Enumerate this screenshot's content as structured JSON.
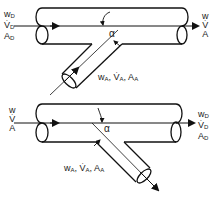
{
  "diagrams": [
    {
      "id": "top",
      "description": "branch pipe merging into main pipe",
      "inlet_main": {
        "w": "w",
        "w_sub": "D",
        "V": "V",
        "V_sub": "D",
        "A": "A",
        "A_sub": "D"
      },
      "outlet_main": {
        "w": "w",
        "V": "V",
        "A": "A"
      },
      "branch": {
        "w": "w",
        "w_sub": "A",
        "V": "V",
        "V_sub": "A",
        "A": "A",
        "A_sub": "A",
        "separator": ","
      },
      "angle_label": "α",
      "branch_flow": "in"
    },
    {
      "id": "bottom",
      "description": "branch pipe splitting from main pipe",
      "inlet_main": {
        "w": "w",
        "V": "V",
        "A": "A"
      },
      "outlet_main": {
        "w": "w",
        "w_sub": "D",
        "V": "V",
        "V_sub": "D",
        "A": "A",
        "A_sub": "D"
      },
      "branch": {
        "w": "w",
        "w_sub": "A",
        "V": "V",
        "V_sub": "A",
        "A": "A",
        "A_sub": "A",
        "separator": ","
      },
      "angle_label": "α",
      "branch_flow": "out"
    }
  ],
  "colors": {
    "line": "#111111",
    "background": "#ffffff"
  }
}
